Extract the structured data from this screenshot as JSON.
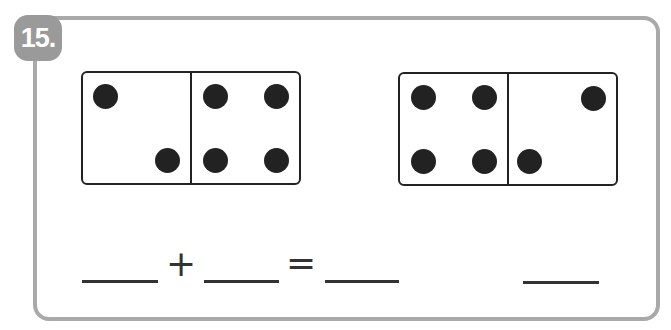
{
  "problem": {
    "number_label": "15.",
    "dominoes": [
      {
        "left_pips": 2,
        "right_pips": 4
      },
      {
        "left_pips": 4,
        "right_pips": 2
      }
    ],
    "equation": {
      "plus": "+",
      "equals": "=",
      "blanks": [
        "",
        "",
        "",
        ""
      ]
    }
  },
  "colors": {
    "frame": "#a9a9a9",
    "badge": "#9a9a9a",
    "ink": "#222222"
  }
}
